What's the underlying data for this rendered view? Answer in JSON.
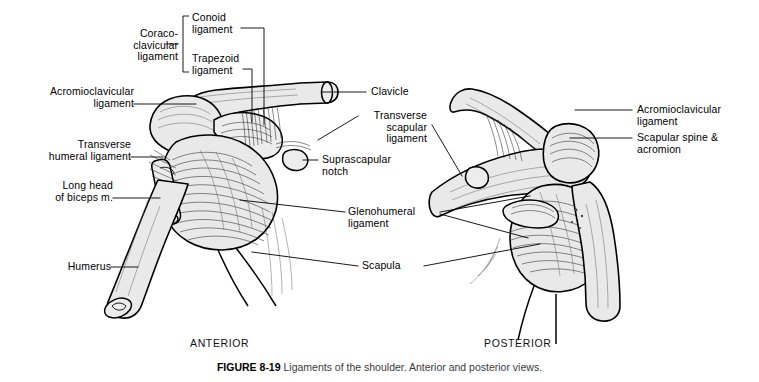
{
  "figure": {
    "caption_number": "FIGURE 8-19",
    "caption_text": " Ligaments of the shoulder. Anterior and posterior views.",
    "view_left": "ANTERIOR",
    "view_right": "POSTERIOR"
  },
  "colors": {
    "background": "#ffffff",
    "bone_fill": "#e9e9e9",
    "ligament_fill": "#f2f2f2",
    "ink": "#000000",
    "caption_text": "#3a3a3a"
  },
  "labels": {
    "coraco_clavicular": "Coraco-\nclavicular\nligament",
    "conoid": "Conoid\nligament",
    "trapezoid": "Trapezoid\nligament",
    "acromioclavicular_left": "Acromioclavicular\nligament",
    "transverse_humeral": "Transverse\nhumeral ligament",
    "long_head_biceps": "Long head\nof biceps m.",
    "humerus": "Humerus",
    "clavicle": "Clavicle",
    "transverse_scapular": "Transverse\nscapular\nligament",
    "suprascapular_notch": "Suprascapular\nnotch",
    "glenohumeral": "Glenohumeral\nligament",
    "scapula": "Scapula",
    "acromioclavicular_right": "Acromioclavicular\nligament",
    "scapular_spine_acromion": "Scapular spine &\nacromion"
  }
}
